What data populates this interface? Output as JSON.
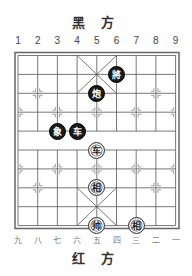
{
  "top_side_label": "黑 方",
  "bottom_side_label": "红 方",
  "top_column_labels": [
    "1",
    "2",
    "3",
    "4",
    "5",
    "6",
    "7",
    "8",
    "9"
  ],
  "bottom_column_labels": [
    "九",
    "八",
    "七",
    "六",
    "五",
    "四",
    "三",
    "二",
    "一"
  ],
  "colors": {
    "black_piece": "#1a1a1a",
    "red_piece_bg": "#ffffff",
    "grid": "#555555"
  },
  "pieces": [
    {
      "side": "black",
      "char": "將",
      "col": 6,
      "row": 2,
      "name": "black-general"
    },
    {
      "side": "black",
      "char": "炮",
      "col": 5,
      "row": 3,
      "name": "black-cannon"
    },
    {
      "side": "black",
      "char": "象",
      "col": 3,
      "row": 5,
      "name": "black-elephant"
    },
    {
      "side": "black",
      "char": "车",
      "col": 4,
      "row": 5,
      "name": "black-chariot"
    },
    {
      "side": "red",
      "char": "车",
      "col": 5,
      "row": 6,
      "name": "red-chariot"
    },
    {
      "side": "red",
      "char": "相",
      "col": 5,
      "row": 8,
      "name": "red-elephant-center"
    },
    {
      "side": "red",
      "char": "帅",
      "col": 5,
      "row": 10,
      "name": "red-general"
    },
    {
      "side": "red",
      "char": "相",
      "col": 7,
      "row": 10,
      "name": "red-elephant-right"
    }
  ]
}
